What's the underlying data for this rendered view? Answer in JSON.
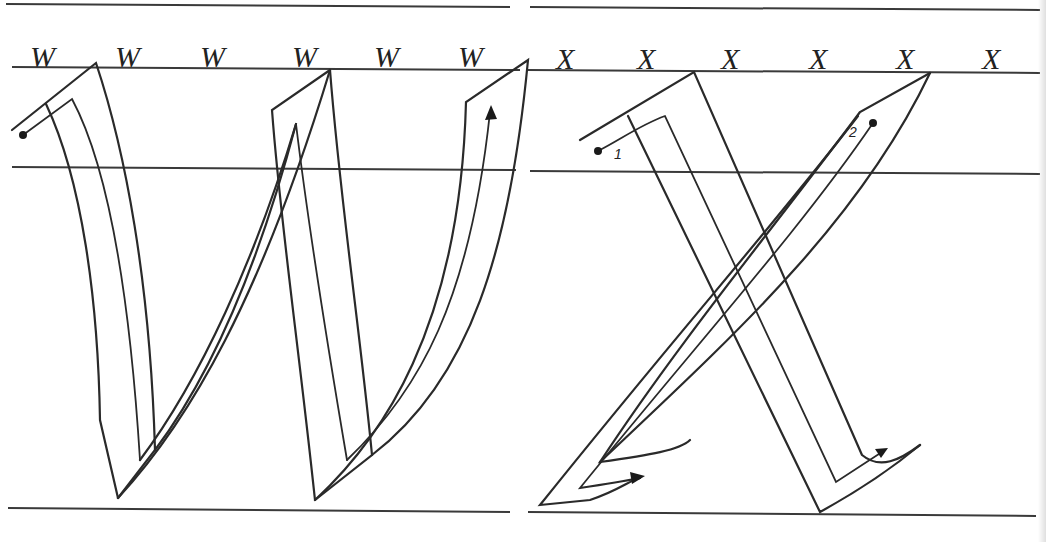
{
  "panels": [
    {
      "id": "w-panel",
      "letter": "W",
      "sample_row": [
        "W",
        "W",
        "W",
        "W",
        "W",
        "W"
      ],
      "stroke_start_marker": "start-dot",
      "stroke_end_marker": "arrow"
    },
    {
      "id": "x-panel",
      "letter": "X",
      "sample_row": [
        "X",
        "X",
        "X",
        "X",
        "X",
        "X"
      ],
      "stroke_numbers": [
        "1",
        "2"
      ],
      "stroke_start_marker": "start-dot",
      "stroke_end_marker": "arrow"
    }
  ],
  "colors": {
    "ink": "#2a2a2a",
    "paper": "#ffffff"
  }
}
